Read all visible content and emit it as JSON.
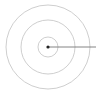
{
  "diagram": {
    "type": "concentric-circles-with-radius",
    "center": {
      "x": 48,
      "y": 47
    },
    "rings": [
      {
        "radius": 10,
        "color": "#c8c8c8"
      },
      {
        "radius": 27,
        "color": "#c8c8c8"
      },
      {
        "radius": 42,
        "color": "#c8c8c8"
      }
    ],
    "center_dot": {
      "radius": 1.6,
      "color": "#222222"
    },
    "radius_line": {
      "x2": 96,
      "color": "#777777"
    }
  }
}
